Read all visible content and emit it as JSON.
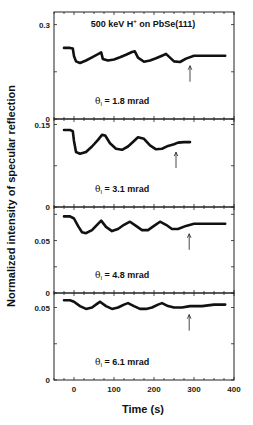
{
  "chart_data": {
    "type": "line",
    "title": "500 keV H+ on PbSe(111)",
    "xlabel": "Time (s)",
    "ylabel": "Normalized intensity of specular reflection",
    "xlim": [
      -50,
      400
    ],
    "xticks": [
      0,
      100,
      200,
      300,
      400
    ],
    "grid": false,
    "legend": null,
    "panels": [
      {
        "annotation": "θI = 1.8 mrad",
        "ylim": [
          0,
          0.34
        ],
        "yticks": [
          0,
          0.3
        ],
        "ytick_labels": [
          "0",
          "0.3"
        ],
        "arrow_x": 290,
        "x": [
          -25,
          -10,
          -3,
          0,
          5,
          15,
          30,
          45,
          60,
          68,
          72,
          85,
          100,
          115,
          130,
          145,
          152,
          160,
          175,
          190,
          205,
          220,
          230,
          240,
          250,
          265,
          280,
          300,
          320,
          340,
          360,
          378
        ],
        "y": [
          0.226,
          0.226,
          0.224,
          0.2,
          0.183,
          0.178,
          0.186,
          0.196,
          0.206,
          0.212,
          0.191,
          0.186,
          0.189,
          0.196,
          0.204,
          0.213,
          0.215,
          0.195,
          0.182,
          0.186,
          0.193,
          0.201,
          0.207,
          0.195,
          0.183,
          0.181,
          0.192,
          0.201,
          0.201,
          0.201,
          0.201,
          0.201
        ]
      },
      {
        "annotation": "θI = 3.1 mrad",
        "ylim": [
          0,
          0.16
        ],
        "yticks": [
          0,
          0.15
        ],
        "ytick_labels": [
          "0",
          "0.15"
        ],
        "arrow_x": 255,
        "x": [
          -25,
          -10,
          -3,
          0,
          5,
          15,
          30,
          45,
          60,
          70,
          78,
          90,
          105,
          120,
          135,
          150,
          160,
          175,
          190,
          205,
          220,
          235,
          250,
          260,
          275,
          290
        ],
        "y": [
          0.14,
          0.14,
          0.138,
          0.12,
          0.1,
          0.097,
          0.1,
          0.11,
          0.122,
          0.131,
          0.13,
          0.116,
          0.106,
          0.104,
          0.11,
          0.12,
          0.127,
          0.124,
          0.112,
          0.105,
          0.106,
          0.111,
          0.114,
          0.117,
          0.118,
          0.118
        ]
      },
      {
        "annotation": "θI = 4.8 mrad",
        "ylim": [
          0,
          0.082
        ],
        "yticks": [
          0,
          0.05
        ],
        "ytick_labels": [
          "0",
          "0.05"
        ],
        "arrow_x": 288,
        "x": [
          -25,
          -10,
          0,
          10,
          20,
          30,
          45,
          60,
          68,
          80,
          95,
          110,
          125,
          140,
          155,
          170,
          185,
          200,
          215,
          230,
          245,
          260,
          280,
          300,
          330,
          360,
          378
        ],
        "y": [
          0.073,
          0.073,
          0.071,
          0.064,
          0.058,
          0.057,
          0.06,
          0.066,
          0.069,
          0.063,
          0.059,
          0.061,
          0.065,
          0.068,
          0.064,
          0.06,
          0.06,
          0.064,
          0.068,
          0.065,
          0.061,
          0.061,
          0.064,
          0.066,
          0.066,
          0.066,
          0.066
        ]
      },
      {
        "annotation": "θI = 6.1 mrad",
        "ylim": [
          0,
          0.06
        ],
        "yticks": [
          0,
          0.05
        ],
        "ytick_labels": [
          "0",
          "0.05"
        ],
        "arrow_x": 288,
        "x": [
          -25,
          -10,
          0,
          15,
          30,
          45,
          60,
          65,
          80,
          95,
          110,
          125,
          135,
          150,
          165,
          180,
          195,
          210,
          220,
          235,
          250,
          270,
          290,
          320,
          350,
          378
        ],
        "y": [
          0.055,
          0.055,
          0.054,
          0.051,
          0.049,
          0.05,
          0.053,
          0.054,
          0.051,
          0.049,
          0.05,
          0.052,
          0.053,
          0.051,
          0.049,
          0.049,
          0.05,
          0.052,
          0.053,
          0.051,
          0.05,
          0.05,
          0.051,
          0.051,
          0.052,
          0.052
        ]
      }
    ]
  }
}
